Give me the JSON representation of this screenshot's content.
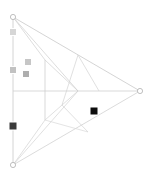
{
  "canvas": {
    "width": 152,
    "height": 182,
    "background": "#ffffff",
    "title": "wireframe-arrow-diagram"
  },
  "style": {
    "wire_color": "#c9c9c9",
    "wire_color_faint": "#d8d8d8",
    "wire_width": 0.7,
    "vertex_stroke": "#b0b0b0",
    "vertex_fill": "#ffffff",
    "vertex_radius": 2.6
  },
  "edges": [
    {
      "name": "left-vertical-axis",
      "x1": 13,
      "y1": 17,
      "x2": 13,
      "y2": 165,
      "color": "#c9c9c9",
      "width": 0.8
    },
    {
      "name": "horizontal-midline",
      "x1": 13,
      "y1": 91,
      "x2": 140,
      "y2": 91,
      "color": "#cfcfcf",
      "width": 0.8
    },
    {
      "name": "interior-vertical",
      "x1": 45,
      "y1": 60,
      "x2": 45,
      "y2": 120,
      "color": "#cfcfcf",
      "width": 0.8
    },
    {
      "name": "top-to-right-vertex",
      "x1": 13,
      "y1": 17,
      "x2": 140,
      "y2": 91,
      "color": "#c9c9c9",
      "width": 0.8
    },
    {
      "name": "bottom-to-right-vertex",
      "x1": 13,
      "y1": 165,
      "x2": 140,
      "y2": 91,
      "color": "#d2d2d2",
      "width": 0.8
    },
    {
      "name": "top-to-arrow-apex",
      "x1": 13,
      "y1": 17,
      "x2": 78,
      "y2": 91,
      "color": "#cfcfcf",
      "width": 0.7
    },
    {
      "name": "bottom-to-arrow-apex",
      "x1": 13,
      "y1": 165,
      "x2": 78,
      "y2": 91,
      "color": "#d2d2d2",
      "width": 0.7
    },
    {
      "name": "top-to-interior-upper",
      "x1": 13,
      "y1": 17,
      "x2": 45,
      "y2": 60,
      "color": "#cfcfcf",
      "width": 0.7
    },
    {
      "name": "bottom-to-interior-lower",
      "x1": 13,
      "y1": 165,
      "x2": 45,
      "y2": 120,
      "color": "#d2d2d2",
      "width": 0.7
    },
    {
      "name": "upper-fold-crease",
      "x1": 45,
      "y1": 60,
      "x2": 78,
      "y2": 91,
      "color": "#cfcfcf",
      "width": 0.7
    },
    {
      "name": "lower-fold-crease",
      "x1": 45,
      "y1": 120,
      "x2": 78,
      "y2": 91,
      "color": "#d2d2d2",
      "width": 0.7
    },
    {
      "name": "upper-panel-diagonal",
      "x1": 78,
      "y1": 55,
      "x2": 62,
      "y2": 105,
      "color": "#d2d2d2",
      "width": 0.7
    },
    {
      "name": "upper-panel-spine",
      "x1": 78,
      "y1": 55,
      "x2": 99,
      "y2": 91,
      "color": "#d2d2d2",
      "width": 0.7
    },
    {
      "name": "lower-panel-diagonal",
      "x1": 62,
      "y1": 105,
      "x2": 88,
      "y2": 132,
      "color": "#d2d2d2",
      "width": 0.7
    },
    {
      "name": "lower-panel-edge",
      "x1": 88,
      "y1": 132,
      "x2": 45,
      "y2": 120,
      "color": "#d8d8d8",
      "width": 0.7
    }
  ],
  "vertices": [
    {
      "name": "vertex-top-left",
      "cx": 13,
      "cy": 17,
      "r": 2.6
    },
    {
      "name": "vertex-bottom-left",
      "cx": 13,
      "cy": 165,
      "r": 2.6
    },
    {
      "name": "vertex-right-apex",
      "cx": 140,
      "cy": 91,
      "r": 2.6
    }
  ],
  "markers": [
    {
      "name": "marker-axis-upper",
      "x": 13,
      "y": 32,
      "size": 7,
      "color": "#d6d6d6"
    },
    {
      "name": "marker-axis-mid",
      "x": 13,
      "y": 70,
      "size": 7,
      "color": "#c2c2c2"
    },
    {
      "name": "marker-float-upper",
      "x": 28,
      "y": 62,
      "size": 7,
      "color": "#c6c6c6"
    },
    {
      "name": "marker-float-lower",
      "x": 26,
      "y": 74,
      "size": 7,
      "color": "#aeaeae"
    },
    {
      "name": "marker-axis-dark",
      "x": 13,
      "y": 126,
      "size": 8,
      "color": "#3a3a3a"
    },
    {
      "name": "marker-field-black",
      "x": 94,
      "y": 111,
      "size": 8,
      "color": "#0d0d0d"
    }
  ]
}
